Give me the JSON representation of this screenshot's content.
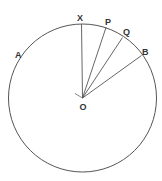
{
  "diagram": {
    "title": "",
    "circle": {
      "cx": 82.5,
      "cy": 98,
      "r": 74,
      "stroke": "#555555"
    },
    "center": {
      "name": "O",
      "x": 82.5,
      "y": 98,
      "label": "O",
      "label_x": 79.5,
      "label_y": 110
    },
    "radii": [
      {
        "name": "OX",
        "x2": 81.5,
        "y2": 24
      },
      {
        "name": "OP",
        "x2": 106,
        "y2": 27.5
      },
      {
        "name": "OQ",
        "x2": 122.5,
        "y2": 37.5
      },
      {
        "name": "OB",
        "x2": 141.5,
        "y2": 55.5
      }
    ],
    "points": [
      {
        "name": "X",
        "label": "X",
        "label_x": 77,
        "label_y": 21
      },
      {
        "name": "P",
        "label": "P",
        "label_x": 105,
        "label_y": 25
      },
      {
        "name": "Q",
        "label": "Q",
        "label_x": 123,
        "label_y": 35
      },
      {
        "name": "B",
        "label": "B",
        "label_x": 142,
        "label_y": 55
      },
      {
        "name": "A",
        "label": "A",
        "label_x": 15,
        "label_y": 58
      }
    ],
    "tick_at_O": {
      "x1": 82.5,
      "y1": 98,
      "x2": 75,
      "y2": 93.5
    }
  }
}
